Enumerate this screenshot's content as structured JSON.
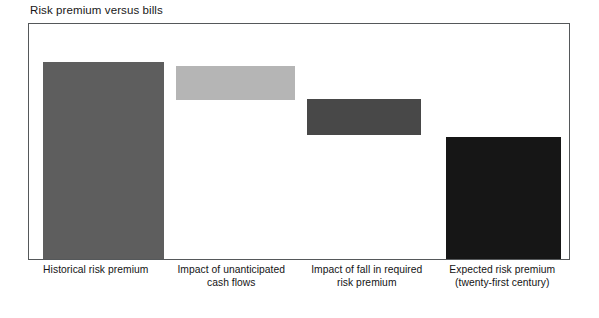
{
  "chart_data": {
    "type": "bar",
    "subtype": "waterfall",
    "title": "Risk premium versus bills",
    "xlabel": "",
    "ylabel": "",
    "grid": false,
    "legend": false,
    "axis_visible": false,
    "tick_labels": [],
    "ylim": [
      0,
      100
    ],
    "categories": [
      "Historical risk premium",
      "Impact of unanticipated cash flows",
      "Impact of fall in required risk premium",
      "Expected risk premium (twenty-first century)"
    ],
    "values": [
      100,
      17,
      19,
      63
    ],
    "bars": [
      {
        "label_line1": "Historical risk premium",
        "label_line2": "",
        "base": 0,
        "top": 100,
        "value": 100,
        "color": "#5e5e5e",
        "kind": "total"
      },
      {
        "label_line1": "Impact of unanticipated",
        "label_line2": "cash flows",
        "base": 81,
        "top": 98,
        "value": 17,
        "color": "#b5b5b5",
        "kind": "delta"
      },
      {
        "label_line1": "Impact of fall in required",
        "label_line2": "risk premium",
        "base": 62,
        "top": 81,
        "value": 19,
        "color": "#484848",
        "kind": "delta"
      },
      {
        "label_line1": "Expected risk premium",
        "label_line2": "(twenty-first century)",
        "base": 0,
        "top": 62,
        "value": 62,
        "color": "#161616",
        "kind": "total"
      }
    ],
    "colors": {
      "bar_1": "#5e5e5e",
      "bar_2": "#b5b5b5",
      "bar_3": "#484848",
      "bar_4": "#161616",
      "frame": "#55585a",
      "background": "#ffffff",
      "text": "#141414"
    },
    "geometry": {
      "plot": {
        "x": 28,
        "y": 23,
        "w": 542,
        "h": 237
      },
      "bar_rects": [
        {
          "x": 14,
          "y": 38,
          "w": 121,
          "h": 197
        },
        {
          "x": 147,
          "y": 42,
          "w": 119,
          "h": 34
        },
        {
          "x": 278,
          "y": 75,
          "w": 114,
          "h": 36
        },
        {
          "x": 417,
          "y": 113,
          "w": 115,
          "h": 122
        }
      ]
    }
  }
}
